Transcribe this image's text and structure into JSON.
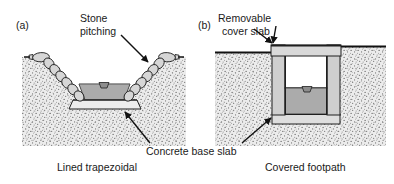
{
  "figure": {
    "title_visible": false,
    "background_color": "#ffffff",
    "panels": [
      {
        "id": "a",
        "marker": "(a)",
        "caption": "Lined trapezoidal",
        "annotations": [
          {
            "name": "stone-pitching",
            "text_line1": "Stone",
            "text_line2": "pitching"
          }
        ],
        "elements": [
          {
            "name": "ground-fill",
            "label": "stippled ground",
            "color": "#e8e8e8"
          },
          {
            "name": "stone-block",
            "label": "stone pitching block",
            "color": "#d4d4d4"
          },
          {
            "name": "water-body",
            "label": "water",
            "color": "#a8a8a8"
          },
          {
            "name": "concrete-base-slab",
            "label": "concrete base slab",
            "color": "#e0e0e0"
          },
          {
            "name": "water-level-marker",
            "label": "water surface marker",
            "color": "#909090"
          }
        ]
      },
      {
        "id": "b",
        "marker": "(b)",
        "caption": "Covered footpath",
        "annotations": [
          {
            "name": "removable-cover-slab",
            "text_line1": "Removable",
            "text_line2": "cover slab"
          }
        ],
        "elements": [
          {
            "name": "ground-fill",
            "label": "stippled ground",
            "color": "#e8e8e8"
          },
          {
            "name": "conduit-wall",
            "label": "concrete wall",
            "color": "#c9c9c9"
          },
          {
            "name": "cover-slab",
            "label": "removable cover slab",
            "color": "#d8d8d8"
          },
          {
            "name": "water-body",
            "label": "water",
            "color": "#a8a8a8"
          },
          {
            "name": "concrete-base-slab",
            "label": "concrete base slab",
            "color": "#d8d8d8"
          },
          {
            "name": "water-level-marker",
            "label": "water surface marker",
            "color": "#909090"
          }
        ]
      }
    ],
    "shared_annotations": [
      {
        "name": "concrete-base-slab-label",
        "text": "Concrete base slab"
      }
    ],
    "colors": {
      "ink": "#1a1a1a",
      "ground": "#e8e8e8",
      "stipple": "#6d6d6d",
      "water": "#a8a8a8",
      "stone": "#d2d2d2",
      "slab": "#dcdcdc",
      "wall": "#c9c9c9",
      "white": "#ffffff"
    }
  }
}
